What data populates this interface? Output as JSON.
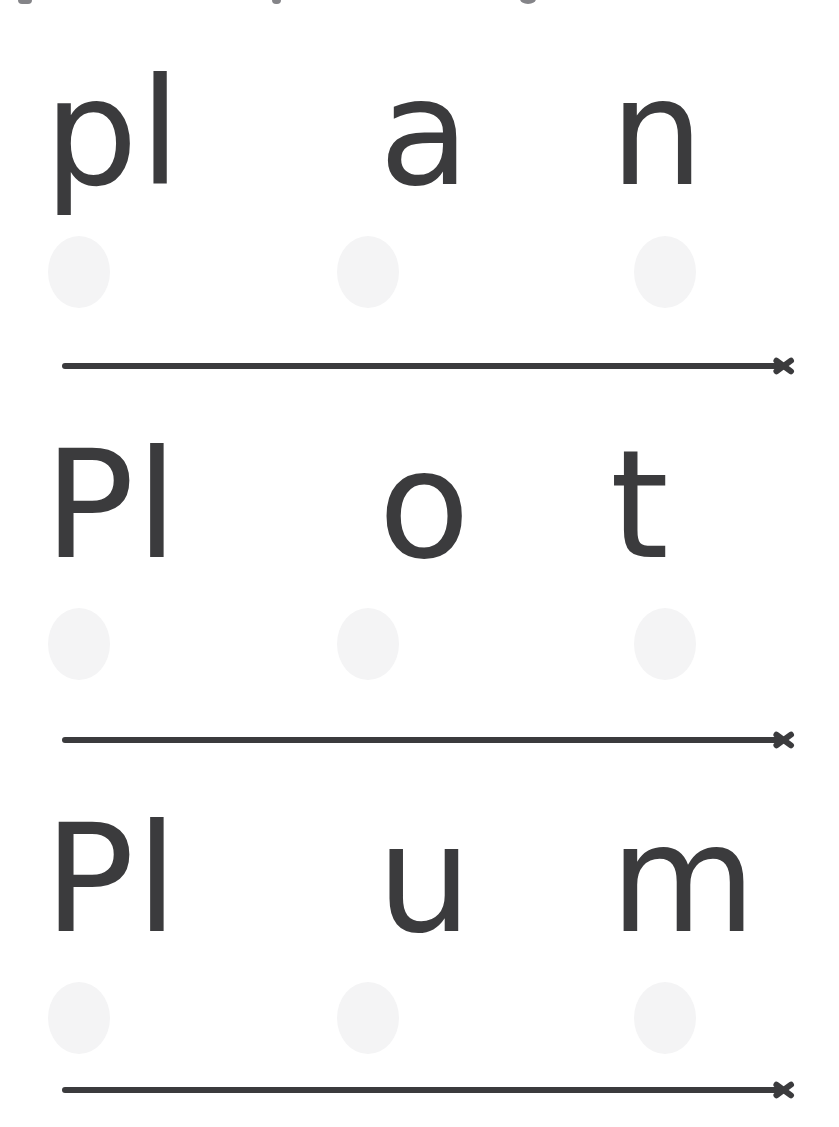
{
  "page": {
    "kind": "phonics-blending-worksheet",
    "background_color": "#ffffff",
    "ink_color": "#3b3b3d",
    "dot_color": "#f4f4f5"
  },
  "top_remnant": {
    "present": true,
    "description": "partial ink fragments clipped at the very top edge"
  },
  "rows": [
    {
      "word": "plan",
      "segments": [
        "pl",
        "a",
        "n"
      ],
      "dot_count": 3,
      "arrow": "blending-arrow-right"
    },
    {
      "word": "Plot",
      "segments": [
        "Pl",
        "o",
        "t"
      ],
      "dot_count": 3,
      "arrow": "blending-arrow-right"
    },
    {
      "word": "Plum",
      "segments": [
        "Pl",
        "u",
        "m"
      ],
      "dot_count": 3,
      "arrow": "blending-arrow-right"
    }
  ]
}
